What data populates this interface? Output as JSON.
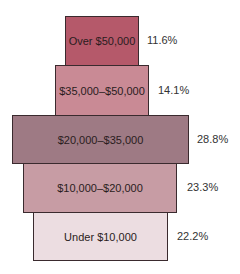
{
  "chart_data": {
    "type": "bar",
    "orientation": "horizontal-pyramid",
    "title": "",
    "xlabel": "",
    "ylabel": "",
    "grid": false,
    "categories": [
      "Over $50,000",
      "$35,000–$50,000",
      "$20,000–$35,000",
      "$10,000–$20,000",
      "Under $10,000"
    ],
    "values": [
      11.6,
      14.1,
      28.8,
      23.3,
      22.2
    ],
    "value_labels": [
      "11.6%",
      "14.1%",
      "28.8%",
      "23.3%",
      "22.2%"
    ],
    "colors": [
      "#b5596a",
      "#c98a95",
      "#9e7a84",
      "#c79ca4",
      "#ecdde1"
    ]
  },
  "bars": [
    {
      "label": "Over $50,000",
      "pct": "11.6%",
      "color": "#b5596a",
      "x": 65,
      "y": 16,
      "w": 74,
      "h": 50,
      "px": 147
    },
    {
      "label": "$35,000–$50,000",
      "pct": "14.1%",
      "color": "#c98a95",
      "x": 55,
      "y": 65,
      "w": 94,
      "h": 51,
      "px": 158
    },
    {
      "label": "$20,000–$35,000",
      "pct": "28.8%",
      "color": "#9e7a84",
      "x": 12,
      "y": 115,
      "w": 177,
      "h": 49,
      "px": 197
    },
    {
      "label": "$10,000–$20,000",
      "pct": "23.3%",
      "color": "#c79ca4",
      "x": 23,
      "y": 163,
      "w": 154,
      "h": 50,
      "px": 187
    },
    {
      "label": "Under $10,000",
      "pct": "22.2%",
      "color": "#ecdde1",
      "x": 33,
      "y": 212,
      "w": 135,
      "h": 49,
      "px": 177
    }
  ]
}
